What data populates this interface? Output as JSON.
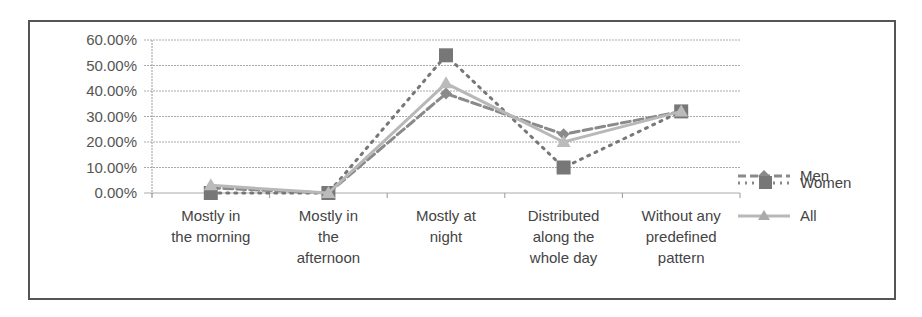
{
  "chart_data": {
    "type": "line",
    "title": "",
    "xlabel": "",
    "ylabel": "",
    "ylim": [
      0,
      60
    ],
    "y_ticks": [
      "0.00%",
      "10.00%",
      "20.00%",
      "30.00%",
      "40.00%",
      "50.00%",
      "60.00%"
    ],
    "grid": true,
    "legend_position": "right",
    "categories": [
      "Mostly in the morning",
      "Mostly in the afternoon",
      "Mostly at night",
      "Distributed along the whole day",
      "Without any predefined pattern"
    ],
    "category_lines": [
      [
        "Mostly in",
        "the morning"
      ],
      [
        "Mostly in",
        "the",
        "afternoon"
      ],
      [
        "Mostly at",
        "night"
      ],
      [
        "Distributed",
        "along the",
        "whole day"
      ],
      [
        "Without any",
        "predefined",
        "pattern"
      ]
    ],
    "series": [
      {
        "name": "Men",
        "values": [
          2,
          0,
          39,
          23,
          32
        ],
        "style": "dashed",
        "marker": "diamond",
        "color": "#8a8a8a"
      },
      {
        "name": "Women",
        "values": [
          0,
          0,
          54,
          10,
          32
        ],
        "style": "dotted",
        "marker": "square",
        "color": "#777777"
      },
      {
        "name": "All",
        "values": [
          3,
          0,
          43,
          20,
          32
        ],
        "style": "solid",
        "marker": "triangle",
        "color": "#b8b8b8"
      }
    ]
  },
  "legend": {
    "men": "Men",
    "women": "Women",
    "all": "All"
  }
}
